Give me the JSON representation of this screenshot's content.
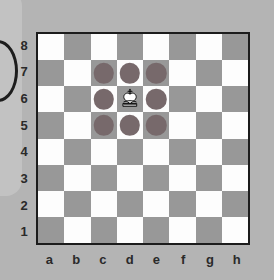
{
  "board": {
    "files": [
      "a",
      "b",
      "c",
      "d",
      "e",
      "f",
      "g",
      "h"
    ],
    "ranks": [
      "8",
      "7",
      "6",
      "5",
      "4",
      "3",
      "2",
      "1"
    ],
    "light_square_color": "#fdfdfd",
    "dark_square_color": "#989898",
    "border_color": "#1c1c1c",
    "background_color": "#b4b4b4",
    "move_dot_color": "#77696b",
    "orientation": "white",
    "pieces": [
      {
        "square": "d6",
        "piece": "white-king",
        "glyph": "♔"
      }
    ],
    "highlighted_moves": [
      "c7",
      "d7",
      "e7",
      "c6",
      "e6",
      "c5",
      "d5",
      "e5"
    ],
    "squares": [
      {
        "id": "a8",
        "shade": "light",
        "dot": false,
        "piece": null
      },
      {
        "id": "b8",
        "shade": "dark",
        "dot": false,
        "piece": null
      },
      {
        "id": "c8",
        "shade": "light",
        "dot": false,
        "piece": null
      },
      {
        "id": "d8",
        "shade": "dark",
        "dot": false,
        "piece": null
      },
      {
        "id": "e8",
        "shade": "light",
        "dot": false,
        "piece": null
      },
      {
        "id": "f8",
        "shade": "dark",
        "dot": false,
        "piece": null
      },
      {
        "id": "g8",
        "shade": "light",
        "dot": false,
        "piece": null
      },
      {
        "id": "h8",
        "shade": "dark",
        "dot": false,
        "piece": null
      },
      {
        "id": "a7",
        "shade": "dark",
        "dot": false,
        "piece": null
      },
      {
        "id": "b7",
        "shade": "light",
        "dot": false,
        "piece": null
      },
      {
        "id": "c7",
        "shade": "dark",
        "dot": true,
        "piece": null
      },
      {
        "id": "d7",
        "shade": "light",
        "dot": true,
        "piece": null
      },
      {
        "id": "e7",
        "shade": "dark",
        "dot": true,
        "piece": null
      },
      {
        "id": "f7",
        "shade": "light",
        "dot": false,
        "piece": null
      },
      {
        "id": "g7",
        "shade": "dark",
        "dot": false,
        "piece": null
      },
      {
        "id": "h7",
        "shade": "light",
        "dot": false,
        "piece": null
      },
      {
        "id": "a6",
        "shade": "light",
        "dot": false,
        "piece": null
      },
      {
        "id": "b6",
        "shade": "dark",
        "dot": false,
        "piece": null
      },
      {
        "id": "c6",
        "shade": "light",
        "dot": true,
        "piece": null
      },
      {
        "id": "d6",
        "shade": "dark",
        "dot": false,
        "piece": "white-king"
      },
      {
        "id": "e6",
        "shade": "light",
        "dot": true,
        "piece": null
      },
      {
        "id": "f6",
        "shade": "dark",
        "dot": false,
        "piece": null
      },
      {
        "id": "g6",
        "shade": "light",
        "dot": false,
        "piece": null
      },
      {
        "id": "h6",
        "shade": "dark",
        "dot": false,
        "piece": null
      },
      {
        "id": "a5",
        "shade": "dark",
        "dot": false,
        "piece": null
      },
      {
        "id": "b5",
        "shade": "light",
        "dot": false,
        "piece": null
      },
      {
        "id": "c5",
        "shade": "dark",
        "dot": true,
        "piece": null
      },
      {
        "id": "d5",
        "shade": "light",
        "dot": true,
        "piece": null
      },
      {
        "id": "e5",
        "shade": "dark",
        "dot": true,
        "piece": null
      },
      {
        "id": "f5",
        "shade": "light",
        "dot": false,
        "piece": null
      },
      {
        "id": "g5",
        "shade": "dark",
        "dot": false,
        "piece": null
      },
      {
        "id": "h5",
        "shade": "light",
        "dot": false,
        "piece": null
      },
      {
        "id": "a4",
        "shade": "light",
        "dot": false,
        "piece": null
      },
      {
        "id": "b4",
        "shade": "dark",
        "dot": false,
        "piece": null
      },
      {
        "id": "c4",
        "shade": "light",
        "dot": false,
        "piece": null
      },
      {
        "id": "d4",
        "shade": "dark",
        "dot": false,
        "piece": null
      },
      {
        "id": "e4",
        "shade": "light",
        "dot": false,
        "piece": null
      },
      {
        "id": "f4",
        "shade": "dark",
        "dot": false,
        "piece": null
      },
      {
        "id": "g4",
        "shade": "light",
        "dot": false,
        "piece": null
      },
      {
        "id": "h4",
        "shade": "dark",
        "dot": false,
        "piece": null
      },
      {
        "id": "a3",
        "shade": "dark",
        "dot": false,
        "piece": null
      },
      {
        "id": "b3",
        "shade": "light",
        "dot": false,
        "piece": null
      },
      {
        "id": "c3",
        "shade": "dark",
        "dot": false,
        "piece": null
      },
      {
        "id": "d3",
        "shade": "light",
        "dot": false,
        "piece": null
      },
      {
        "id": "e3",
        "shade": "dark",
        "dot": false,
        "piece": null
      },
      {
        "id": "f3",
        "shade": "light",
        "dot": false,
        "piece": null
      },
      {
        "id": "g3",
        "shade": "dark",
        "dot": false,
        "piece": null
      },
      {
        "id": "h3",
        "shade": "light",
        "dot": false,
        "piece": null
      },
      {
        "id": "a2",
        "shade": "light",
        "dot": false,
        "piece": null
      },
      {
        "id": "b2",
        "shade": "dark",
        "dot": false,
        "piece": null
      },
      {
        "id": "c2",
        "shade": "light",
        "dot": false,
        "piece": null
      },
      {
        "id": "d2",
        "shade": "dark",
        "dot": false,
        "piece": null
      },
      {
        "id": "e2",
        "shade": "light",
        "dot": false,
        "piece": null
      },
      {
        "id": "f2",
        "shade": "dark",
        "dot": false,
        "piece": null
      },
      {
        "id": "g2",
        "shade": "light",
        "dot": false,
        "piece": null
      },
      {
        "id": "h2",
        "shade": "dark",
        "dot": false,
        "piece": null
      },
      {
        "id": "a1",
        "shade": "dark",
        "dot": false,
        "piece": null
      },
      {
        "id": "b1",
        "shade": "light",
        "dot": false,
        "piece": null
      },
      {
        "id": "c1",
        "shade": "dark",
        "dot": false,
        "piece": null
      },
      {
        "id": "d1",
        "shade": "light",
        "dot": false,
        "piece": null
      },
      {
        "id": "e1",
        "shade": "dark",
        "dot": false,
        "piece": null
      },
      {
        "id": "f1",
        "shade": "light",
        "dot": false,
        "piece": null
      },
      {
        "id": "g1",
        "shade": "dark",
        "dot": false,
        "piece": null
      },
      {
        "id": "h1",
        "shade": "light",
        "dot": false,
        "piece": null
      }
    ]
  }
}
